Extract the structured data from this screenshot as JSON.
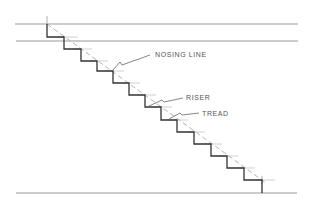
{
  "diagram": {
    "type": "stair-section",
    "labels": {
      "nosing_line": "NOSING LINE",
      "riser": "RISER",
      "tread": "TREAD"
    },
    "colors": {
      "stair_line": "#333333",
      "guide_line": "#999999",
      "nosing_dash": "#aaaaaa",
      "label_text": "#555555",
      "background": "#ffffff"
    },
    "step_count": 13
  }
}
